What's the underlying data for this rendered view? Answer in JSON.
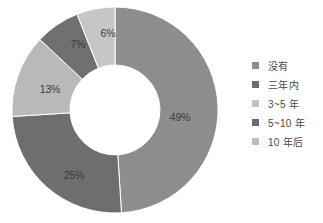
{
  "chart_data": {
    "type": "pie",
    "variant": "donut",
    "title": "",
    "subtitle": "",
    "xlabel": "",
    "ylabel": "",
    "grid": false,
    "legend_position": "right",
    "start_angle_deg": 0,
    "direction": "clockwise",
    "center": {
      "x": 107,
      "y": 108
    },
    "outer_radius": 103,
    "inner_radius": 45,
    "categories": [
      "没有",
      "三年内",
      "3~5 年",
      "5~10 年",
      "10 年后"
    ],
    "values": [
      49,
      25,
      13,
      7,
      6
    ],
    "value_unit": "%",
    "data_labels": [
      "49%",
      "25%",
      "13%",
      "7%",
      "6%"
    ],
    "colors": [
      "#8d8d8d",
      "#6e6e6e",
      "#b9b9b9",
      "#707070",
      "#c6c6c6"
    ],
    "slices": [
      {
        "label": "没有",
        "value": 49,
        "data_label": "49%",
        "color": "#8d8d8d",
        "label_x": 172,
        "label_y": 116
      },
      {
        "label": "三年内",
        "value": 25,
        "data_label": "25%",
        "color": "#6e6e6e",
        "label_x": 66,
        "label_y": 174
      },
      {
        "label": "3~5 年",
        "value": 13,
        "data_label": "13%",
        "color": "#b9b9b9",
        "label_x": 42,
        "label_y": 88
      },
      {
        "label": "5~10 年",
        "value": 7,
        "data_label": "7%",
        "color": "#707070",
        "label_x": 70,
        "label_y": 43
      },
      {
        "label": "10 年后",
        "value": 6,
        "data_label": "6%",
        "color": "#c6c6c6",
        "label_x": 100,
        "label_y": 32
      }
    ]
  },
  "legend": {
    "items": [
      {
        "label": "没有",
        "color": "#8d8d8d"
      },
      {
        "label": "三年内",
        "color": "#6e6e6e"
      },
      {
        "label": "3~5 年",
        "color": "#c3c3c3"
      },
      {
        "label": "5~10 年",
        "color": "#6b6b6b"
      },
      {
        "label": "10 年后",
        "color": "#bdbdbd"
      }
    ]
  },
  "page": {
    "background_color": "#ffffff",
    "text_color": "#4a4a4a"
  }
}
